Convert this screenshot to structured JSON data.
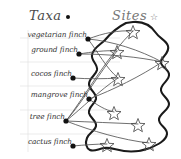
{
  "figure": {
    "type": "bipartite-network-map",
    "background": "#ffffff",
    "width": 181,
    "height": 159
  },
  "headers": {
    "taxa": {
      "label": "Taxa",
      "marker": "filled-circle-icon",
      "color": "#4a4a4a"
    },
    "sites": {
      "label": "Sites",
      "marker": "open-star-icon",
      "color": "#777777"
    }
  },
  "colors": {
    "node_dot": "#111111",
    "star_outline": "#4a4a4a",
    "link": "#555555",
    "coastline": "#1a1a1a",
    "rule_line": "#dddddd",
    "text": "#333333"
  },
  "taxa": [
    {
      "id": "vegetarian",
      "label": "vegetarian finch",
      "dot_x": 88,
      "dot_y": 39,
      "label_x": 87,
      "label_y": 30
    },
    {
      "id": "ground",
      "label": "ground finch",
      "dot_x": 79,
      "dot_y": 54,
      "label_x": 78,
      "label_y": 45
    },
    {
      "id": "cocos",
      "label": "cocos finch",
      "dot_x": 73,
      "dot_y": 78,
      "label_x": 72,
      "label_y": 69
    },
    {
      "id": "mangrove",
      "label": "mangrove finch",
      "dot_x": 89,
      "dot_y": 99,
      "label_x": 88,
      "label_y": 90
    },
    {
      "id": "tree",
      "label": "tree finch",
      "dot_x": 66,
      "dot_y": 121,
      "label_x": 65,
      "label_y": 112
    },
    {
      "id": "cactus",
      "label": "cactus finch",
      "dot_x": 73,
      "dot_y": 146,
      "label_x": 72,
      "label_y": 137
    }
  ],
  "sites": [
    {
      "id": "s1",
      "x": 133,
      "y": 31
    },
    {
      "id": "s2",
      "x": 117,
      "y": 51
    },
    {
      "id": "s3",
      "x": 162,
      "y": 62
    },
    {
      "id": "s4",
      "x": 118,
      "y": 78
    },
    {
      "id": "s5",
      "x": 114,
      "y": 112
    },
    {
      "id": "s6",
      "x": 138,
      "y": 124
    },
    {
      "id": "s7",
      "x": 107,
      "y": 144
    },
    {
      "id": "s8",
      "x": 149,
      "y": 143
    }
  ],
  "links": [
    {
      "from": "vegetarian",
      "to": "s1"
    },
    {
      "from": "vegetarian",
      "to": "s3"
    },
    {
      "from": "vegetarian",
      "to": "s4"
    },
    {
      "from": "ground",
      "to": "s2"
    },
    {
      "from": "ground",
      "to": "s3"
    },
    {
      "from": "cocos",
      "to": "s4"
    },
    {
      "from": "mangrove",
      "to": "s3"
    },
    {
      "from": "mangrove",
      "to": "s5"
    },
    {
      "from": "tree",
      "to": "s1"
    },
    {
      "from": "tree",
      "to": "s2"
    },
    {
      "from": "tree",
      "to": "s4"
    },
    {
      "from": "tree",
      "to": "s6"
    },
    {
      "from": "tree",
      "to": "s8"
    },
    {
      "from": "cactus",
      "to": "s7"
    }
  ],
  "rules": {
    "horizontal_y": [
      38,
      62,
      86,
      110,
      134
    ],
    "vertical_x": 28
  }
}
